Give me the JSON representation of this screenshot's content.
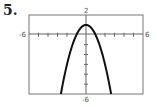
{
  "problem_number": "5.",
  "chart_data": {
    "type": "line",
    "title": "",
    "xlabel": "",
    "ylabel": "",
    "xlim": [
      -6,
      6
    ],
    "ylim": [
      -6,
      2
    ],
    "x_tick_labels": [
      "-6",
      "6"
    ],
    "y_tick_labels": [
      "2",
      "-6"
    ],
    "grid": false,
    "tick_interval": 1,
    "series": [
      {
        "name": "y = -x^2 + 1",
        "equation": "y = -x^2 + 1",
        "vertex": [
          0,
          1
        ],
        "x": [
          -2.65,
          -2,
          -1,
          0,
          1,
          2,
          2.65
        ],
        "values": [
          -6,
          -3,
          0,
          1,
          0,
          -3,
          -6
        ]
      }
    ]
  },
  "labels": {
    "x_min": "-6",
    "x_max": "6",
    "y_max": "2",
    "y_min": "-6"
  }
}
